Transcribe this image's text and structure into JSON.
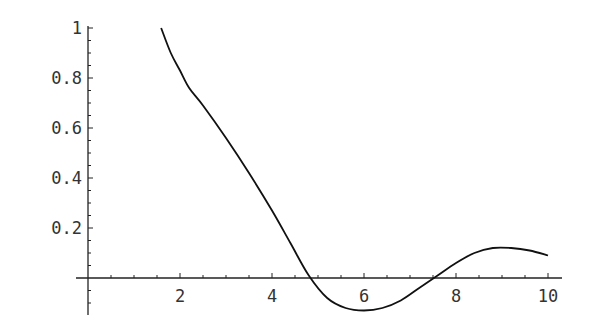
{
  "chart_data": {
    "type": "line",
    "title": "",
    "xlabel": "",
    "ylabel": "",
    "xlim": [
      0,
      10.3
    ],
    "ylim": [
      -0.14,
      1.0
    ],
    "grid": false,
    "legend": null,
    "x_ticks": [
      "2",
      "4",
      "6",
      "8",
      "10"
    ],
    "y_ticks": [
      "0.2",
      "0.4",
      "0.6",
      "0.8",
      "1"
    ],
    "series": [
      {
        "name": "f(x)",
        "color": "#111111",
        "x": [
          1.59,
          1.8,
          2.0,
          2.2,
          2.5,
          3.0,
          3.5,
          4.0,
          4.4,
          4.8,
          5.2,
          5.6,
          6.0,
          6.4,
          6.8,
          7.2,
          7.6,
          8.0,
          8.4,
          8.8,
          9.2,
          9.6,
          10.0
        ],
        "values": [
          1.0,
          0.9,
          0.83,
          0.76,
          0.69,
          0.56,
          0.42,
          0.27,
          0.14,
          0.01,
          -0.08,
          -0.12,
          -0.13,
          -0.12,
          -0.09,
          -0.04,
          0.01,
          0.06,
          0.1,
          0.12,
          0.12,
          0.11,
          0.09
        ]
      }
    ]
  }
}
